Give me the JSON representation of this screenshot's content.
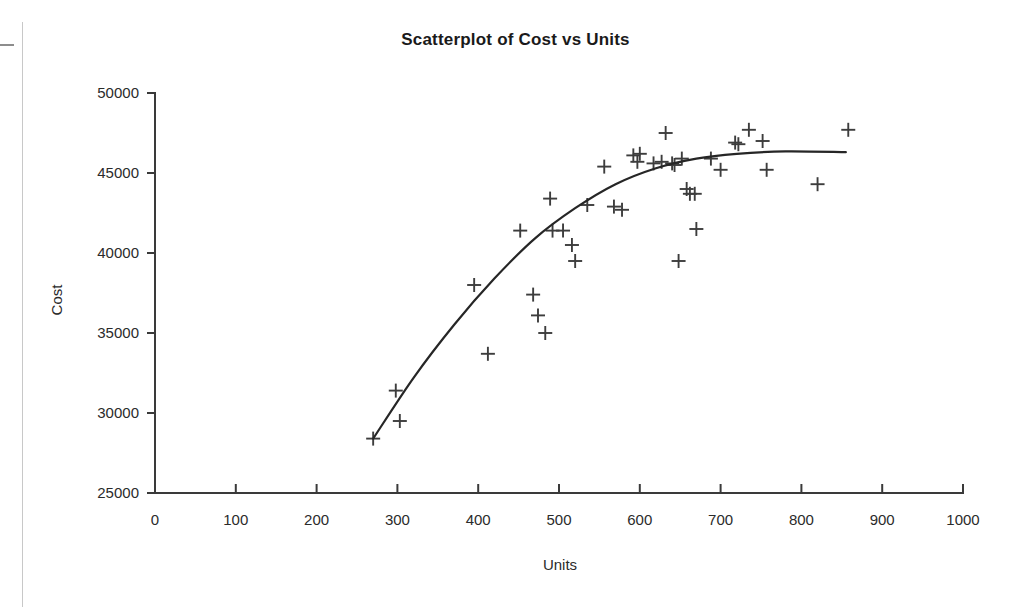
{
  "chart_data": {
    "type": "scatter",
    "title": "Scatterplot of Cost vs Units",
    "xlabel": "Units",
    "ylabel": "Cost",
    "xlim": [
      0,
      1000
    ],
    "ylim": [
      25000,
      50000
    ],
    "xticks": [
      0,
      100,
      200,
      300,
      400,
      500,
      600,
      700,
      800,
      900,
      1000
    ],
    "yticks": [
      25000,
      30000,
      35000,
      40000,
      45000,
      50000
    ],
    "xtick_labels": [
      "0",
      "100",
      "200",
      "300",
      "400",
      "500",
      "600",
      "700",
      "800",
      "900",
      "1000"
    ],
    "ytick_labels": [
      "25000",
      "30000",
      "35000",
      "40000",
      "45000",
      "50000"
    ],
    "grid": false,
    "legend": false,
    "marker": "plus",
    "marker_color": "#3d3d3d",
    "series": [
      {
        "name": "Cost vs Units",
        "points": [
          [
            270,
            28400
          ],
          [
            298,
            31400
          ],
          [
            303,
            29500
          ],
          [
            395,
            38000
          ],
          [
            412,
            33700
          ],
          [
            452,
            41400
          ],
          [
            468,
            37400
          ],
          [
            474,
            36100
          ],
          [
            483,
            35000
          ],
          [
            489,
            43400
          ],
          [
            492,
            41400
          ],
          [
            505,
            41400
          ],
          [
            516,
            40500
          ],
          [
            520,
            39500
          ],
          [
            535,
            43000
          ],
          [
            556,
            45400
          ],
          [
            568,
            42900
          ],
          [
            578,
            42700
          ],
          [
            592,
            46100
          ],
          [
            597,
            45700
          ],
          [
            600,
            46200
          ],
          [
            617,
            45600
          ],
          [
            627,
            45700
          ],
          [
            632,
            47500
          ],
          [
            640,
            45600
          ],
          [
            643,
            45500
          ],
          [
            648,
            39500
          ],
          [
            652,
            45900
          ],
          [
            658,
            44000
          ],
          [
            662,
            43700
          ],
          [
            668,
            43700
          ],
          [
            670,
            41500
          ],
          [
            688,
            45900
          ],
          [
            700,
            45200
          ],
          [
            718,
            46900
          ],
          [
            722,
            46800
          ],
          [
            735,
            47700
          ],
          [
            752,
            47000
          ],
          [
            757,
            45200
          ],
          [
            820,
            44300
          ],
          [
            858,
            47700
          ]
        ]
      }
    ],
    "trend_line": {
      "name": "fitted curve",
      "shape": "concave-increasing-plateau",
      "x_start": 270,
      "x_end": 855,
      "points": [
        [
          270,
          28400
        ],
        [
          320,
          32200
        ],
        [
          370,
          35500
        ],
        [
          420,
          38400
        ],
        [
          470,
          40900
        ],
        [
          520,
          42800
        ],
        [
          570,
          44300
        ],
        [
          620,
          45300
        ],
        [
          670,
          45900
        ],
        [
          720,
          46200
        ],
        [
          780,
          46350
        ],
        [
          855,
          46300
        ]
      ]
    }
  }
}
